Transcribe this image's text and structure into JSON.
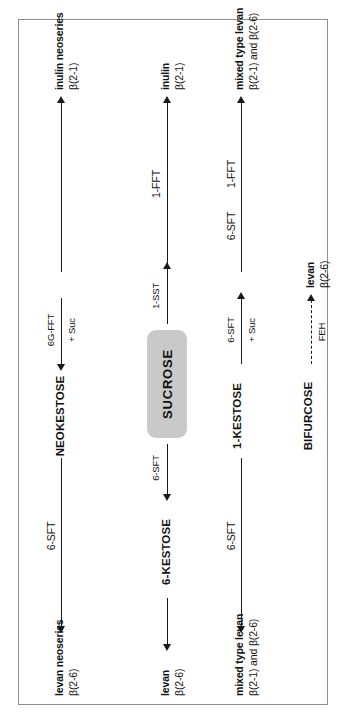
{
  "figure": {
    "type": "diagram",
    "orientation": "rotated 90 degrees counter-clockwise",
    "border_color": "#8e8e8e"
  },
  "substrate": {
    "label": "SUCROSE",
    "box_color": "#c9c9c9"
  },
  "rows": [
    {
      "id": "row-neokestose",
      "intermediate": "NEOKESTOSE",
      "left_product": {
        "name": "levan neoseries",
        "linkage": "β(2-6)"
      },
      "right_product": {
        "name": "inulin neoseries",
        "linkage": "β(2-1)"
      },
      "left_arrow_enzyme": "6-SFT",
      "right_arrow_enzyme": "",
      "to_intermediate_enzyme": "6G-FFT",
      "to_intermediate_cosubstrate": "+ Suc"
    },
    {
      "id": "row-1-kestose",
      "intermediate": "1-KESTOSE",
      "left_product": {
        "name": "levan",
        "linkage": "β(2-6)"
      },
      "right_product": {
        "name": "inulin",
        "linkage": "β(2-1)"
      },
      "left_intermediate": "6-KESTOSE",
      "left_arrow_enzyme": "6-SFT",
      "right_arrow_enzyme": "1-FFT",
      "from_sucrose_enzyme": "1-SST",
      "to_right_enzyme": "6-SFT",
      "to_right_cosubstrate": "+ Suc"
    },
    {
      "id": "row-bifurcose",
      "intermediate": "BIFURCOSE",
      "left_product": {
        "name": "mixed type levan",
        "linkage": "β(2-1) and β(2-6)"
      },
      "right_product": {
        "name": "mixed type levan",
        "linkage": "β(2-1) and β(2-6)"
      },
      "left_arrow_enzyme": "6-SFT",
      "right_arrow_enzyme": "1-FFT",
      "feh_enzyme": "FEH",
      "feh_upper_enzyme": "6-SFT",
      "feh_lower_enzyme": "1-FFT",
      "feh_product": {
        "name": "levan",
        "linkage": "β(2-6)"
      }
    }
  ],
  "enzymes": {
    "sst": "1-SST",
    "sft": "6-SFT",
    "fft": "1-FFT",
    "gfft": "6G-FFT",
    "feh": "FEH",
    "cosubstrate": "+ Suc"
  }
}
